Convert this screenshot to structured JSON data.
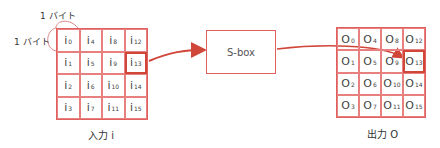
{
  "labels": {
    "byte_top": "1 バイト",
    "byte_left": "1 バイト",
    "input_caption": "入力 i",
    "output_caption": "出力 O",
    "sbox": "S-box"
  },
  "input_grid": {
    "symbol": "i",
    "cells": [
      [
        "0",
        "4",
        "8",
        "12"
      ],
      [
        "1",
        "5",
        "9",
        "13"
      ],
      [
        "2",
        "6",
        "10",
        "14"
      ],
      [
        "3",
        "7",
        "11",
        "15"
      ]
    ],
    "highlight": "13"
  },
  "output_grid": {
    "symbol": "O",
    "cells": [
      [
        "0",
        "4",
        "8",
        "12"
      ],
      [
        "1",
        "5",
        "9",
        "13"
      ],
      [
        "2",
        "6",
        "10",
        "14"
      ],
      [
        "3",
        "7",
        "11",
        "15"
      ]
    ],
    "highlight": "13"
  },
  "colors": {
    "accent": "#d0473a",
    "grid_line": "#e88080"
  }
}
